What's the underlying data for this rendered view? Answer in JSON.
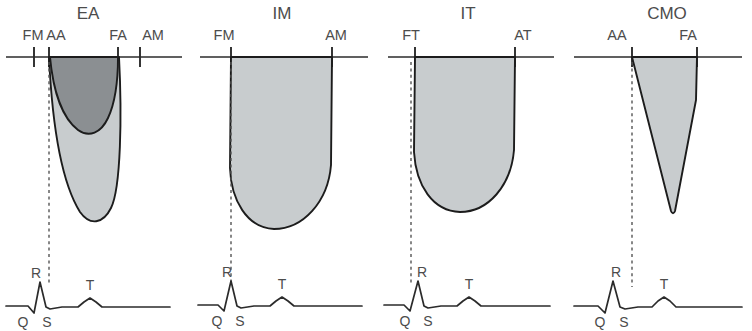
{
  "figure": {
    "title": "",
    "background_color": "#ffffff",
    "width": 752,
    "height": 331,
    "colors": {
      "envelope_light_fill": "#c8ccce",
      "envelope_dark_fill": "#8b8f92",
      "outline": "#1c1c1c",
      "baseline": "#2b2b2b",
      "text": "#4c4c4c",
      "sync_line": "#555555"
    }
  },
  "ecg_labels": {
    "q": "Q",
    "r": "R",
    "s": "S",
    "t": "T"
  },
  "panels": [
    {
      "id": "ea",
      "title": "EA",
      "event_labels": [
        "FM",
        "AA",
        "FA",
        "AM"
      ],
      "envelopes": [
        {
          "name": "outer-envelope",
          "shade": "light",
          "start_label": "AA",
          "end_label": "FA"
        },
        {
          "name": "inner-envelope",
          "shade": "dark",
          "start_label": "AA",
          "end_label": "FA"
        }
      ],
      "ecg": {
        "labels": [
          "Q",
          "R",
          "S",
          "T"
        ]
      }
    },
    {
      "id": "im",
      "title": "IM",
      "event_labels": [
        "FM",
        "AM"
      ],
      "envelopes": [
        {
          "name": "outer-envelope",
          "shade": "light",
          "start_label": "FM",
          "end_label": "AM"
        }
      ],
      "ecg": {
        "labels": [
          "Q",
          "R",
          "S",
          "T"
        ]
      }
    },
    {
      "id": "it",
      "title": "IT",
      "event_labels": [
        "FT",
        "AT"
      ],
      "envelopes": [
        {
          "name": "outer-envelope",
          "shade": "light",
          "start_label": "FT",
          "end_label": "AT"
        }
      ],
      "ecg": {
        "labels": [
          "Q",
          "R",
          "S",
          "T"
        ]
      }
    },
    {
      "id": "cmo",
      "title": "CMO",
      "event_labels": [
        "AA",
        "FA"
      ],
      "envelopes": [
        {
          "name": "outer-envelope",
          "shade": "light",
          "start_label": "AA",
          "end_label": "FA"
        }
      ],
      "ecg": {
        "labels": [
          "Q",
          "R",
          "S",
          "T"
        ]
      }
    }
  ]
}
